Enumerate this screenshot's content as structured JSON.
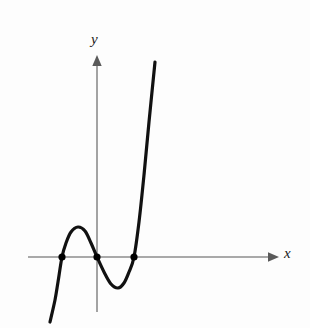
{
  "figure": {
    "title": "",
    "background_color": "#fdfdfd",
    "width": 310,
    "height": 328
  },
  "axes": {
    "x_label": "x",
    "y_label": "y",
    "axis_color": "#8c8c8c",
    "arrow_color": "#5a5a5a"
  },
  "curve": {
    "color": "#111111",
    "stroke_width": 3.2
  },
  "markers": {
    "color": "#000000",
    "radius": 3.6,
    "count": 3
  },
  "chart_data": {
    "type": "line",
    "title": "",
    "subtitle": "",
    "xlabel": "x",
    "ylabel": "y",
    "grid": false,
    "legend": null,
    "axis_origin_px": {
      "x": 97,
      "y": 257
    },
    "xlim": [
      -2.1,
      5.2
    ],
    "ylim": [
      -3.6,
      11.2
    ],
    "series": [
      {
        "name": "cubic",
        "kind": "curve",
        "points_px": [
          [
            50,
            322
          ],
          [
            55,
            300
          ],
          [
            58,
            282
          ],
          [
            62,
            257
          ],
          [
            66,
            243
          ],
          [
            71,
            232
          ],
          [
            78,
            227
          ],
          [
            85,
            231
          ],
          [
            91,
            243
          ],
          [
            97,
            257
          ],
          [
            104,
            272
          ],
          [
            111,
            284
          ],
          [
            118,
            288
          ],
          [
            124,
            283
          ],
          [
            129,
            272
          ],
          [
            134,
            257
          ],
          [
            139,
            222
          ],
          [
            144,
            175
          ],
          [
            149,
            122
          ],
          [
            155,
            62
          ]
        ]
      }
    ],
    "annotations": [
      {
        "name": "root-1",
        "type": "point",
        "px": [
          62,
          257
        ],
        "label": ""
      },
      {
        "name": "root-2",
        "type": "point",
        "px": [
          97,
          257
        ],
        "label": ""
      },
      {
        "name": "root-3",
        "type": "point",
        "px": [
          134,
          257
        ],
        "label": ""
      },
      {
        "name": "local-maximum",
        "type": "extremum",
        "px": [
          78,
          227
        ],
        "label": ""
      },
      {
        "name": "local-minimum",
        "type": "extremum",
        "px": [
          118,
          288
        ],
        "label": ""
      }
    ],
    "x_axis_px": {
      "x_start": 28,
      "x_end": 278,
      "y": 257
    },
    "y_axis_px": {
      "y_start": 55,
      "y_end": 312,
      "x": 97
    }
  }
}
